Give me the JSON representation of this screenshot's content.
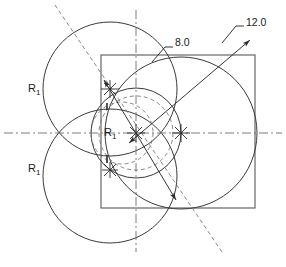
{
  "drawing": {
    "title": "Geometric construction with three tangent circles inside a square",
    "colors": {
      "object_line": "#2b2b2b",
      "hidden_line": "#6e6e6e",
      "center_line": "#6e6e6e",
      "dimension_line": "#2b2b2b",
      "text": "#1a1a1a",
      "background": "#ffffff"
    },
    "labels": {
      "radius_upper_left": "R",
      "radius_upper_left_sub": "1",
      "radius_lower_left": "R",
      "radius_lower_left_sub": "1",
      "radius_center": "R",
      "radius_center_sub": "1",
      "dim_small": "8.0",
      "dim_large": "12.0"
    },
    "square": {
      "x": 101,
      "y": 55,
      "width": 154,
      "height": 153,
      "name": "bounding-square"
    },
    "center_lines": {
      "horizontal_y": 133,
      "vertical_x": 136,
      "diagonal_from": [
        55,
        5
      ],
      "diagonal_to": [
        222,
        252
      ]
    },
    "circles": [
      {
        "name": "circle-upper-left",
        "cx": 110,
        "cy": 89,
        "r": 67,
        "style": "solid"
      },
      {
        "name": "circle-lower-left",
        "cx": 110,
        "cy": 176,
        "r": 67,
        "style": "solid"
      },
      {
        "name": "circle-right",
        "cx": 181,
        "cy": 133,
        "r": 76,
        "style": "solid"
      },
      {
        "name": "circle-center-small",
        "cx": 136,
        "cy": 133,
        "r": 45,
        "style": "solid"
      },
      {
        "name": "construction-circle-upper",
        "cx": 136,
        "cy": 133,
        "r": 37,
        "style": "dashed"
      },
      {
        "name": "construction-circle-lower",
        "cx": 122,
        "cy": 133,
        "r": 31,
        "style": "dashed"
      }
    ],
    "center_marks": [
      {
        "name": "center-mark-upper",
        "cx": 110,
        "cy": 89
      },
      {
        "name": "center-mark-origin",
        "cx": 136,
        "cy": 133
      },
      {
        "name": "center-mark-right",
        "cx": 181,
        "cy": 133
      },
      {
        "name": "center-mark-lower",
        "cx": 110,
        "cy": 170
      }
    ],
    "dimensions": [
      {
        "name": "dim-leader-8",
        "value": "8.0",
        "leader_from": [
          166,
          48
        ],
        "leader_to": [
          159,
          59
        ],
        "text_x": 176,
        "text_y": 42
      },
      {
        "name": "dim-leader-12",
        "value": "12.0",
        "leader_from": [
          237,
          27
        ],
        "leader_to": [
          229,
          37
        ],
        "text_x": 244,
        "text_y": 22
      }
    ],
    "radial_dim_lines": [
      {
        "name": "radial-dim-line-small",
        "x1": 110,
        "y1": 89,
        "x2": 173,
        "y2": 196
      },
      {
        "name": "radial-dim-line-large",
        "x1": 136,
        "y1": 133,
        "x2": 247,
        "y2": 44
      }
    ]
  }
}
